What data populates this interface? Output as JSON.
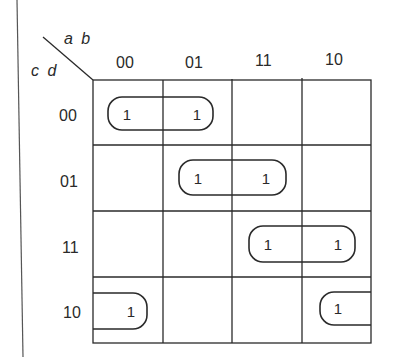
{
  "kmap": {
    "title_vars": {
      "top": "a b",
      "left": "c d"
    },
    "column_labels": [
      "00",
      "01",
      "11",
      "10"
    ],
    "row_labels": [
      "00",
      "01",
      "11",
      "10"
    ],
    "cells": [
      [
        "1",
        "1",
        "",
        ""
      ],
      [
        "",
        "1",
        "1",
        ""
      ],
      [
        "",
        "",
        "1",
        "1"
      ],
      [
        "1",
        "",
        "",
        "1"
      ]
    ],
    "groups": [
      {
        "name": "group-row00-cols00-01",
        "row": "00",
        "cols": [
          "00",
          "01"
        ]
      },
      {
        "name": "group-row01-cols01-11",
        "row": "01",
        "cols": [
          "01",
          "11"
        ]
      },
      {
        "name": "group-row11-cols11-10",
        "row": "11",
        "cols": [
          "11",
          "10"
        ]
      },
      {
        "name": "group-row10-wrap-cols10-00",
        "row": "10",
        "cols": [
          "10",
          "00"
        ],
        "wraparound": true
      }
    ],
    "colors": {
      "ink": "#2a2a2a",
      "background": "#ffffff"
    }
  }
}
